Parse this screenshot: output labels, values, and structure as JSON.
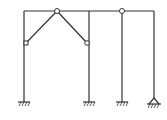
{
  "diagram": {
    "type": "structural-frame",
    "line_color": "#333333",
    "background": "#ffffff",
    "top_beam": {
      "x1": 24,
      "x2": 154,
      "y": 11
    },
    "columns": [
      {
        "name": "column-1",
        "x": 24,
        "y_top": 11,
        "y_bottom": 102,
        "support": "fixed"
      },
      {
        "name": "column-2",
        "x": 89,
        "y_top": 11,
        "y_bottom": 102,
        "support": "fixed"
      },
      {
        "name": "column-3",
        "x": 122,
        "y_top": 11,
        "y_bottom": 102,
        "support": "fixed"
      },
      {
        "name": "column-4",
        "x": 154,
        "y_top": 11,
        "y_bottom": 102,
        "support": "pin"
      }
    ],
    "hinges": [
      {
        "name": "hinge-top-center",
        "x": 57,
        "y": 11
      },
      {
        "name": "hinge-left",
        "x": 26,
        "y": 43
      },
      {
        "name": "hinge-right",
        "x": 87,
        "y": 43
      },
      {
        "name": "hinge-top-right",
        "x": 122,
        "y": 11
      }
    ],
    "braces": [
      {
        "name": "brace-left",
        "from": "hinge-top-center",
        "to": "hinge-left"
      },
      {
        "name": "brace-right",
        "from": "hinge-top-center",
        "to": "hinge-right"
      }
    ]
  }
}
